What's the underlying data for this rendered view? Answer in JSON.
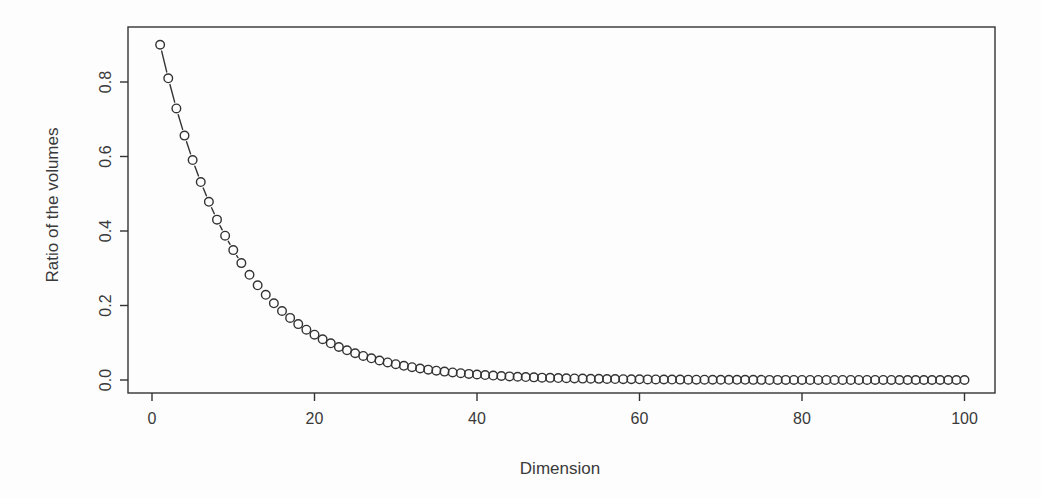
{
  "figure": {
    "background": "#fdfdfd",
    "ink_color": "#333333",
    "text_color": "#3a3a3a"
  },
  "chart_data": {
    "type": "scatter",
    "marker": "open-circle",
    "connector": "dashed-segments-between-separated-points",
    "title": "",
    "xlabel": "Dimension",
    "ylabel": "Ratio of the volumes",
    "xlim": [
      0,
      100
    ],
    "ylim": [
      0,
      0.9
    ],
    "grid": false,
    "legend": "none",
    "x_tick_values": [
      0,
      20,
      40,
      60,
      80,
      100
    ],
    "x_tick_labels": [
      "0",
      "20",
      "40",
      "60",
      "80",
      "100"
    ],
    "y_tick_values": [
      0,
      0.2,
      0.4,
      0.6,
      0.8
    ],
    "y_tick_labels": [
      "0.0",
      "0.2",
      "0.4",
      "0.6",
      "0.8"
    ],
    "x": [
      1,
      2,
      3,
      4,
      5,
      6,
      7,
      8,
      9,
      10,
      11,
      12,
      13,
      14,
      15,
      16,
      17,
      18,
      19,
      20,
      21,
      22,
      23,
      24,
      25,
      26,
      27,
      28,
      29,
      30,
      31,
      32,
      33,
      34,
      35,
      36,
      37,
      38,
      39,
      40,
      41,
      42,
      43,
      44,
      45,
      46,
      47,
      48,
      49,
      50,
      51,
      52,
      53,
      54,
      55,
      56,
      57,
      58,
      59,
      60,
      61,
      62,
      63,
      64,
      65,
      66,
      67,
      68,
      69,
      70,
      71,
      72,
      73,
      74,
      75,
      76,
      77,
      78,
      79,
      80,
      81,
      82,
      83,
      84,
      85,
      86,
      87,
      88,
      89,
      90,
      91,
      92,
      93,
      94,
      95,
      96,
      97,
      98,
      99,
      100
    ],
    "y": [
      0.9,
      0.81,
      0.729,
      0.6561,
      0.59049,
      0.53144,
      0.4783,
      0.43047,
      0.38742,
      0.34868,
      0.31381,
      0.28243,
      0.25419,
      0.22877,
      0.20589,
      0.1853,
      0.16677,
      0.15009,
      0.13509,
      0.12158,
      0.10942,
      0.09848,
      0.08863,
      0.07977,
      0.07179,
      0.06461,
      0.05815,
      0.05233,
      0.0471,
      0.04239,
      0.03815,
      0.03434,
      0.0309,
      0.02781,
      0.02503,
      0.02253,
      0.02028,
      0.01825,
      0.01642,
      0.01478,
      0.0133,
      0.01197,
      0.01078,
      0.0097,
      0.00873,
      0.00786,
      0.00707,
      0.00636,
      0.00573,
      0.00515,
      0.00464,
      0.00417,
      0.00376,
      0.00338,
      0.00304,
      0.00274,
      0.00247,
      0.00222,
      0.002,
      0.0018,
      0.00162,
      0.00146,
      0.00131,
      0.00118,
      0.00106,
      0.00096,
      0.00086,
      0.00077,
      0.0007,
      0.00063,
      0.00056,
      0.00051,
      0.00046,
      0.00041,
      0.00037,
      0.00033,
      0.0003,
      0.00027,
      0.00024,
      0.00022,
      0.0002,
      0.00018,
      0.00016,
      0.00014,
      0.00013,
      0.00012,
      0.0001,
      9e-05,
      8e-05,
      8e-05,
      7e-05,
      6e-05,
      6e-05,
      5e-05,
      5e-05,
      4e-05,
      4e-05,
      3e-05,
      3e-05,
      3e-05
    ]
  }
}
